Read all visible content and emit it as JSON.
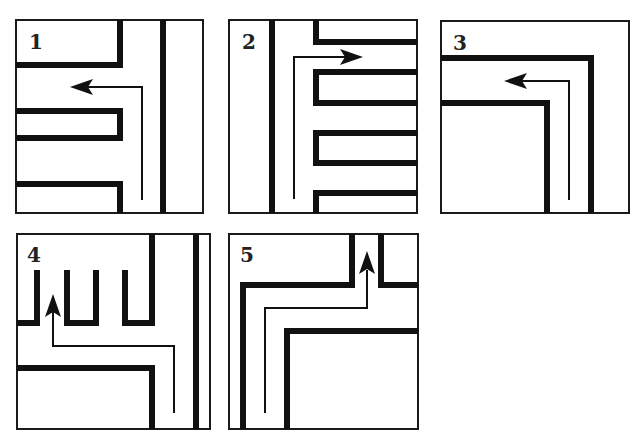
{
  "figure": {
    "panels": [
      {
        "id": 1,
        "label": "1",
        "arrow_direction": "up-then-left"
      },
      {
        "id": 2,
        "label": "2",
        "arrow_direction": "up-then-right"
      },
      {
        "id": 3,
        "label": "3",
        "arrow_direction": "up-then-left"
      },
      {
        "id": 4,
        "label": "4",
        "arrow_direction": "up-left-then-up"
      },
      {
        "id": 5,
        "label": "5",
        "arrow_direction": "up-right-then-up"
      }
    ]
  },
  "colors": {
    "wall": "#111111",
    "background": "#ffffff",
    "frame": "#1a1a1a"
  }
}
